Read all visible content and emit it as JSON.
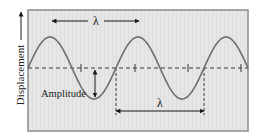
{
  "diagram": {
    "type": "transverse-wave",
    "y_axis_label": "Displacement",
    "amplitude_label": "Amplitude",
    "wavelength_label_top": "λ",
    "wavelength_label_bottom": "λ",
    "colors": {
      "panel_fill": "#e6e6e6",
      "panel_border": "#8c8c8c",
      "wave": "#6e6e6e",
      "dashed": "#3a3a3a",
      "arrow": "#1a1a1a",
      "text": "#222222"
    },
    "geometry": {
      "panel": {
        "x": 28,
        "y": 10,
        "w": 220,
        "h": 121
      },
      "center_y": 68,
      "amplitude_px": 31,
      "wavelength_px": 88,
      "phase_start_x": 28,
      "ticks_x": [
        81,
        135,
        188,
        241
      ],
      "dashed_verticals_x": [
        116,
        204
      ],
      "top_arrow": {
        "x1": 52,
        "x2": 139,
        "y": 21
      },
      "bottom_arrow": {
        "x1": 116,
        "x2": 204,
        "y": 111
      },
      "amplitude_arrow": {
        "x": 95,
        "y1": 69,
        "y2": 98
      }
    }
  }
}
